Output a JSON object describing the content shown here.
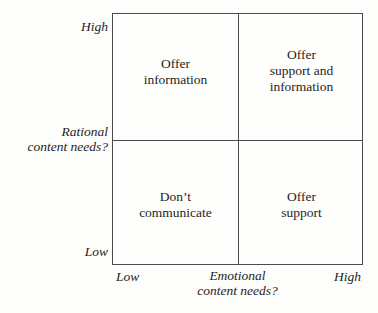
{
  "figure": {
    "type": "2x2-matrix",
    "background_color": "#fdfdfc",
    "line_color": "#4a4a50"
  },
  "y_axis": {
    "title": "Rational\ncontent needs?",
    "high_label": "High",
    "low_label": "Low"
  },
  "x_axis": {
    "title": "Emotional\ncontent needs?",
    "low_label": "Low",
    "high_label": "High"
  },
  "quadrants": {
    "top_left": {
      "text": "Offer\ninformation",
      "rational": "High",
      "emotional": "Low"
    },
    "top_right": {
      "text": "Offer\nsupport and\ninformation",
      "rational": "High",
      "emotional": "High"
    },
    "bottom_left": {
      "text": "Don’t\ncommunicate",
      "rational": "Low",
      "emotional": "Low"
    },
    "bottom_right": {
      "text": "Offer\nsupport",
      "rational": "Low",
      "emotional": "High"
    }
  },
  "chart_data": {
    "type": "table",
    "title": "",
    "xlabel": "Emotional content needs?",
    "ylabel": "Rational content needs?",
    "x_ticks": [
      "Low",
      "High"
    ],
    "y_ticks": [
      "Low",
      "High"
    ],
    "grid": true,
    "legend": null,
    "cells": [
      {
        "x": "Low",
        "y": "High",
        "label": "Offer information"
      },
      {
        "x": "High",
        "y": "High",
        "label": "Offer support and information"
      },
      {
        "x": "Low",
        "y": "Low",
        "label": "Don’t communicate"
      },
      {
        "x": "High",
        "y": "Low",
        "label": "Offer support"
      }
    ]
  }
}
